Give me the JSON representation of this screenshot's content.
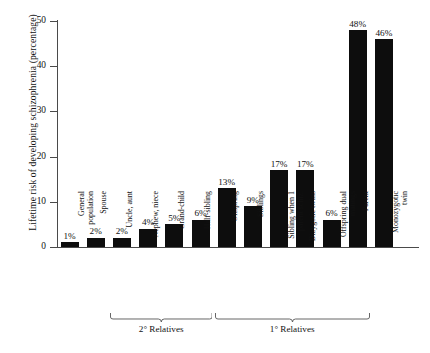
{
  "chart_data": {
    "type": "bar",
    "title": "",
    "xlabel": "",
    "ylabel": "Lifetime risk of developing schizophrenia (percentage)",
    "ylim": [
      0,
      50
    ],
    "yticks": [
      0,
      10,
      20,
      30,
      40,
      50
    ],
    "ytick_labels": [
      "0",
      "10",
      "20",
      "30",
      "40",
      "50"
    ],
    "grid": false,
    "legend": false,
    "bar_color": "#0d0d0d",
    "categories": [
      "General population",
      "Spouse",
      "Uncle, aunt",
      "Nephew, niece",
      "Grand-child",
      "Half-sibling",
      "Offspring",
      "Siblings",
      "Sibling when 1 parent schiz.",
      "Dizygotic twins",
      "Offspring dual matings",
      "Parent",
      "Monozygotic twin"
    ],
    "category_lines": [
      [
        "General",
        "population"
      ],
      [
        "Spouse",
        ""
      ],
      [
        "Uncle, aunt",
        ""
      ],
      [
        "Nephew, niece",
        ""
      ],
      [
        "Grand-child",
        ""
      ],
      [
        "Half-sibling",
        ""
      ],
      [
        "Offspring",
        ""
      ],
      [
        "Siblings",
        ""
      ],
      [
        "Sibling when 1",
        "parent schiz."
      ],
      [
        "Dizygotic twins",
        ""
      ],
      [
        "Offspring dual",
        "matings"
      ],
      [
        "Parent",
        ""
      ],
      [
        "Monozygotic",
        "twin"
      ]
    ],
    "values": [
      1,
      2,
      2,
      4,
      5,
      6,
      13,
      9,
      17,
      17,
      6,
      48,
      46
    ],
    "value_labels": [
      "1%",
      "2%",
      "2%",
      "4%",
      "5%",
      "6%",
      "13%",
      "9%",
      "17%",
      "17%",
      "6%",
      "48%",
      "46%"
    ],
    "annotations": [
      {
        "label": "2° Relatives",
        "first_category_index": 2,
        "last_category_index": 5
      },
      {
        "label": "1° Relatives",
        "first_category_index": 6,
        "last_category_index": 11
      }
    ]
  }
}
